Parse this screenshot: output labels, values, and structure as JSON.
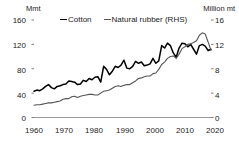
{
  "axes": {
    "left_unit": "Mmt",
    "right_unit": "Million mt",
    "left_ticks": [
      "160",
      "120",
      "80",
      "40",
      "0"
    ],
    "right_ticks": [
      "16",
      "12",
      "8",
      "4",
      "0"
    ],
    "x_ticks": [
      "1960",
      "1970",
      "1980",
      "1990",
      "2000",
      "2010",
      "2020"
    ]
  },
  "legend": {
    "items": [
      {
        "label": "Cotton",
        "color": "#000000"
      },
      {
        "label": "Natural rubber (RHS)",
        "color": "#555555"
      }
    ]
  },
  "chart_data": {
    "type": "line",
    "title": "",
    "subtitle": "",
    "xlabel": "",
    "ylabel": "Mmt",
    "y2label": "Million mt",
    "xlim": [
      1960,
      2021
    ],
    "ylim": [
      0,
      160
    ],
    "y2lim": [
      0,
      16
    ],
    "yticks": [
      0,
      40,
      80,
      120,
      160
    ],
    "y2ticks": [
      0,
      4,
      8,
      12,
      16
    ],
    "xticks": [
      1960,
      1970,
      1980,
      1990,
      2000,
      2010,
      2020
    ],
    "grid": false,
    "legend_position": "top",
    "x": [
      1960,
      1961,
      1962,
      1963,
      1964,
      1965,
      1966,
      1967,
      1968,
      1969,
      1970,
      1971,
      1972,
      1973,
      1974,
      1975,
      1976,
      1977,
      1978,
      1979,
      1980,
      1981,
      1982,
      1983,
      1984,
      1985,
      1986,
      1987,
      1988,
      1989,
      1990,
      1991,
      1992,
      1993,
      1994,
      1995,
      1996,
      1997,
      1998,
      1999,
      2000,
      2001,
      2002,
      2003,
      2004,
      2005,
      2006,
      2007,
      2008,
      2009,
      2010,
      2011,
      2012,
      2013,
      2014,
      2015,
      2016,
      2017,
      2018,
      2019,
      2020,
      2021
    ],
    "series": [
      {
        "name": "Cotton",
        "axis": "left",
        "unit": "Mmt",
        "color": "#000000",
        "values": [
          43,
          45,
          44,
          47,
          51,
          54,
          49,
          47,
          51,
          52,
          54,
          55,
          60,
          59,
          58,
          54,
          55,
          61,
          59,
          64,
          62,
          66,
          67,
          58,
          84,
          79,
          70,
          76,
          84,
          82,
          86,
          94,
          81,
          80,
          84,
          92,
          89,
          91,
          85,
          86,
          88,
          97,
          89,
          93,
          118,
          114,
          122,
          118,
          106,
          99,
          114,
          122,
          121,
          116,
          120,
          112,
          104,
          118,
          120,
          117,
          110,
          112
        ]
      },
      {
        "name": "Natural rubber (RHS)",
        "axis": "right",
        "unit": "Million mt",
        "color": "#555555",
        "values": [
          2.0,
          2.1,
          2.1,
          2.2,
          2.3,
          2.4,
          2.4,
          2.5,
          2.6,
          2.7,
          3.0,
          3.1,
          3.1,
          3.4,
          3.5,
          3.3,
          3.5,
          3.6,
          3.7,
          3.8,
          3.8,
          3.7,
          3.7,
          4.0,
          4.3,
          4.4,
          4.5,
          4.8,
          5.1,
          5.2,
          5.1,
          5.3,
          5.4,
          5.4,
          5.7,
          6.0,
          6.4,
          6.5,
          6.7,
          6.8,
          6.8,
          7.2,
          7.3,
          7.9,
          8.7,
          9.1,
          9.7,
          10.0,
          10.1,
          9.7,
          10.4,
          11.3,
          11.6,
          12.0,
          12.1,
          12.3,
          12.6,
          13.5,
          13.9,
          13.7,
          12.4,
          11.0
        ]
      }
    ]
  }
}
